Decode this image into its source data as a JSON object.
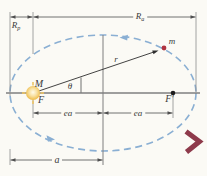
{
  "figure": {
    "type": "elliptical-orbit-diagram",
    "labels": {
      "rp": {
        "base": "R",
        "sub": "p"
      },
      "ra": {
        "base": "R",
        "sub": "a"
      },
      "central_mass": "M",
      "focus_left": "F",
      "focus_right": "F′",
      "theta": "θ",
      "radius_vector": "r",
      "orbiting_mass": "m",
      "ea_left": "ea",
      "ea_right": "ea",
      "semimajor_axis": "a"
    },
    "colors": {
      "page_bg": "#fbfaf5",
      "orbit": "#8aafd3",
      "axis": "#7f7f7f",
      "extension": "#8d8d8d",
      "dimension": "#4f4f4f",
      "vector": "#2e2e2e",
      "text": "#3a3a3a",
      "sun_edge": "#dfa52f",
      "sun_ray": "#eec463",
      "planet_dot": "#b0323e",
      "focus_dot": "#1c1c1c",
      "chevron": "#8e3a4b"
    }
  }
}
